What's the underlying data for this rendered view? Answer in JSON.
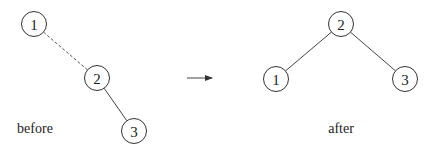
{
  "diagram": {
    "type": "tree-rotation",
    "before": {
      "caption": "before",
      "caption_pos": {
        "x": 35,
        "y": 133
      },
      "nodes": [
        {
          "id": "1",
          "label": "1",
          "x": 34,
          "y": 24
        },
        {
          "id": "2",
          "label": "2",
          "x": 97,
          "y": 78
        },
        {
          "id": "3",
          "label": "3",
          "x": 134,
          "y": 131
        }
      ],
      "edges": [
        {
          "from": "1",
          "to": "2",
          "style": "dashed"
        },
        {
          "from": "2",
          "to": "3",
          "style": "solid"
        }
      ]
    },
    "arrow": {
      "x1": 187,
      "y1": 78,
      "x2": 212,
      "y2": 78,
      "color": "#333333"
    },
    "after": {
      "caption": "after",
      "caption_pos": {
        "x": 341,
        "y": 133
      },
      "nodes": [
        {
          "id": "2",
          "label": "2",
          "x": 341,
          "y": 24
        },
        {
          "id": "1",
          "label": "1",
          "x": 276,
          "y": 79
        },
        {
          "id": "3",
          "label": "3",
          "x": 405,
          "y": 79
        }
      ],
      "edges": [
        {
          "from": "2",
          "to": "1",
          "style": "solid"
        },
        {
          "from": "2",
          "to": "3",
          "style": "solid"
        }
      ]
    },
    "node_radius": 12.5
  }
}
